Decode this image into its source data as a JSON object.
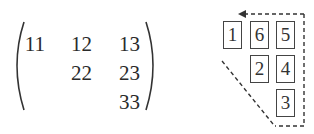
{
  "matrix": {
    "rows": [
      [
        "11",
        "12",
        "13"
      ],
      [
        "",
        "22",
        "23"
      ],
      [
        "",
        "",
        "33"
      ]
    ]
  },
  "storage_diagram": {
    "boxes": [
      {
        "label": "1",
        "row": 0,
        "col": 0
      },
      {
        "label": "6",
        "row": 0,
        "col": 1
      },
      {
        "label": "5",
        "row": 0,
        "col": 2
      },
      {
        "label": "2",
        "row": 1,
        "col": 1
      },
      {
        "label": "4",
        "row": 1,
        "col": 2
      },
      {
        "label": "3",
        "row": 2,
        "col": 2
      }
    ],
    "path_style": "dashed",
    "arrow": "arrow-left-icon"
  }
}
